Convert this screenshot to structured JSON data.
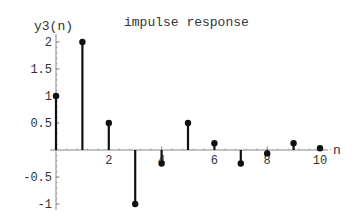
{
  "chart_data": {
    "type": "stem",
    "title": "impulse response",
    "xlabel": "n",
    "ylabel": "y3(n)",
    "x": [
      0,
      1,
      2,
      3,
      4,
      5,
      6,
      7,
      8,
      9,
      10
    ],
    "values": [
      1,
      2,
      0.5,
      -1,
      -0.25,
      0.5,
      0.125,
      -0.25,
      -0.0625,
      0.125,
      0.03125
    ],
    "xticks": [
      "2",
      "4",
      "6",
      "8",
      "10"
    ],
    "xtick_values": [
      2,
      4,
      6,
      8,
      10
    ],
    "yticks": [
      "-1",
      "-0.5",
      "0.5",
      "1",
      "1.5",
      "2"
    ],
    "ytick_values": [
      -1,
      -0.5,
      0.5,
      1,
      1.5,
      2
    ],
    "xlim": [
      0,
      10.5
    ],
    "ylim": [
      -1,
      2
    ],
    "grid": false,
    "legend": null,
    "colors": {
      "stem": "#111111",
      "axis": "#888888",
      "text": "#333333"
    }
  }
}
